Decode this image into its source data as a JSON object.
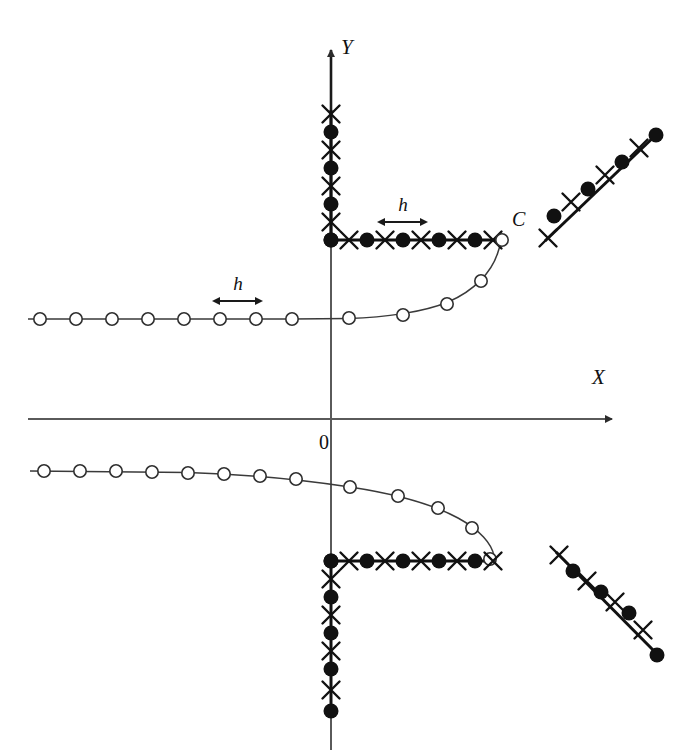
{
  "figure": {
    "background": "#ffffff",
    "ink": "#111111",
    "curve_stroke": "#3a3a3a",
    "axis_stroke": "#4a4a4a"
  },
  "labels": {
    "y_axis": "Y",
    "x_axis": "X",
    "origin": "0",
    "curve": "C",
    "spacing_upper": "h",
    "spacing_lower": "h"
  },
  "markers": {
    "filled_circle": "filled-node-marker",
    "cross": "cross-node-marker",
    "open_circle": "open-node-marker"
  },
  "chart_data": {
    "type": "scatter",
    "xlabel": "X",
    "ylabel": "Y",
    "grid": false,
    "legend": "none",
    "axes": {
      "origin_px": [
        331,
        419
      ],
      "y_axis_top_px": 44,
      "x_axis_right_px": 620,
      "spacing_h_px": 36
    },
    "series": [
      {
        "name": "upper-vertical-filled-nodes",
        "marker": "filled-circle",
        "points_px": [
          [
            331,
            240
          ],
          [
            331,
            204
          ],
          [
            331,
            168
          ],
          [
            331,
            132
          ]
        ]
      },
      {
        "name": "upper-vertical-cross-nodes",
        "marker": "cross",
        "points_px": [
          [
            331,
            222
          ],
          [
            331,
            186
          ],
          [
            331,
            150
          ],
          [
            331,
            114
          ]
        ]
      },
      {
        "name": "upper-horizontal-filled-nodes",
        "marker": "filled-circle",
        "points_px": [
          [
            331,
            240
          ],
          [
            367,
            240
          ],
          [
            403,
            240
          ],
          [
            439,
            240
          ],
          [
            475,
            240
          ]
        ]
      },
      {
        "name": "upper-horizontal-cross-nodes",
        "marker": "cross",
        "points_px": [
          [
            349,
            240
          ],
          [
            385,
            240
          ],
          [
            421,
            240
          ],
          [
            457,
            240
          ],
          [
            493,
            240
          ]
        ]
      },
      {
        "name": "upper-curve-open-nodes",
        "marker": "open-circle",
        "points_px": [
          [
            40,
            319
          ],
          [
            76,
            319
          ],
          [
            112,
            319
          ],
          [
            148,
            319
          ],
          [
            184,
            319
          ],
          [
            220,
            319
          ],
          [
            256,
            319
          ],
          [
            292,
            319
          ],
          [
            349,
            318
          ],
          [
            403,
            315
          ],
          [
            447,
            304
          ],
          [
            481,
            281
          ],
          [
            502,
            240
          ]
        ]
      },
      {
        "name": "upper-right-diagonal-filled-nodes",
        "marker": "filled-circle",
        "points_px": [
          [
            656,
            135
          ],
          [
            622,
            162
          ],
          [
            588,
            189
          ],
          [
            554,
            216
          ]
        ]
      },
      {
        "name": "upper-right-diagonal-cross-nodes",
        "marker": "cross",
        "points_px": [
          [
            639,
            148
          ],
          [
            605,
            175
          ],
          [
            571,
            202
          ],
          [
            548,
            238
          ]
        ]
      },
      {
        "name": "lower-curve-open-nodes",
        "marker": "open-circle",
        "points_px": [
          [
            44,
            471
          ],
          [
            80,
            471
          ],
          [
            116,
            471
          ],
          [
            152,
            472
          ],
          [
            188,
            473
          ],
          [
            224,
            474
          ],
          [
            260,
            476
          ],
          [
            296,
            479
          ],
          [
            350,
            487
          ],
          [
            398,
            496
          ],
          [
            438,
            508
          ],
          [
            472,
            528
          ],
          [
            490,
            559
          ]
        ]
      },
      {
        "name": "lower-horizontal-filled-nodes",
        "marker": "filled-circle",
        "points_px": [
          [
            331,
            561
          ],
          [
            367,
            561
          ],
          [
            403,
            561
          ],
          [
            439,
            561
          ],
          [
            475,
            561
          ]
        ]
      },
      {
        "name": "lower-horizontal-cross-nodes",
        "marker": "cross",
        "points_px": [
          [
            349,
            561
          ],
          [
            385,
            561
          ],
          [
            421,
            561
          ],
          [
            457,
            561
          ],
          [
            493,
            561
          ]
        ]
      },
      {
        "name": "lower-vertical-filled-nodes",
        "marker": "filled-circle",
        "points_px": [
          [
            331,
            561
          ],
          [
            331,
            597
          ],
          [
            331,
            633
          ],
          [
            331,
            669
          ],
          [
            331,
            711
          ]
        ]
      },
      {
        "name": "lower-vertical-cross-nodes",
        "marker": "cross",
        "points_px": [
          [
            331,
            579
          ],
          [
            331,
            615
          ],
          [
            331,
            651
          ],
          [
            331,
            690
          ]
        ]
      },
      {
        "name": "lower-right-diagonal-filled-nodes",
        "marker": "filled-circle",
        "points_px": [
          [
            573,
            571
          ],
          [
            601,
            592
          ],
          [
            629,
            613
          ],
          [
            657,
            655
          ]
        ]
      },
      {
        "name": "lower-right-diagonal-cross-nodes",
        "marker": "cross",
        "points_px": [
          [
            559,
            555
          ],
          [
            587,
            581
          ],
          [
            615,
            602
          ],
          [
            643,
            630
          ]
        ]
      }
    ],
    "annotations": [
      {
        "text": "h",
        "type": "spacing-dimension",
        "at_px": [
          403,
          208
        ],
        "span_px": [
          385,
          421
        ]
      },
      {
        "text": "h",
        "type": "spacing-dimension",
        "at_px": [
          238,
          289
        ],
        "span_px": [
          220,
          256
        ]
      },
      {
        "text": "C",
        "type": "curve-label",
        "at_px": [
          518,
          222
        ]
      },
      {
        "text": "0",
        "type": "origin-label",
        "at_px": [
          325,
          447
        ]
      },
      {
        "text": "Y",
        "type": "axis-label",
        "at_px": [
          345,
          52
        ]
      },
      {
        "text": "X",
        "type": "axis-label",
        "at_px": [
          600,
          380
        ]
      }
    ]
  }
}
